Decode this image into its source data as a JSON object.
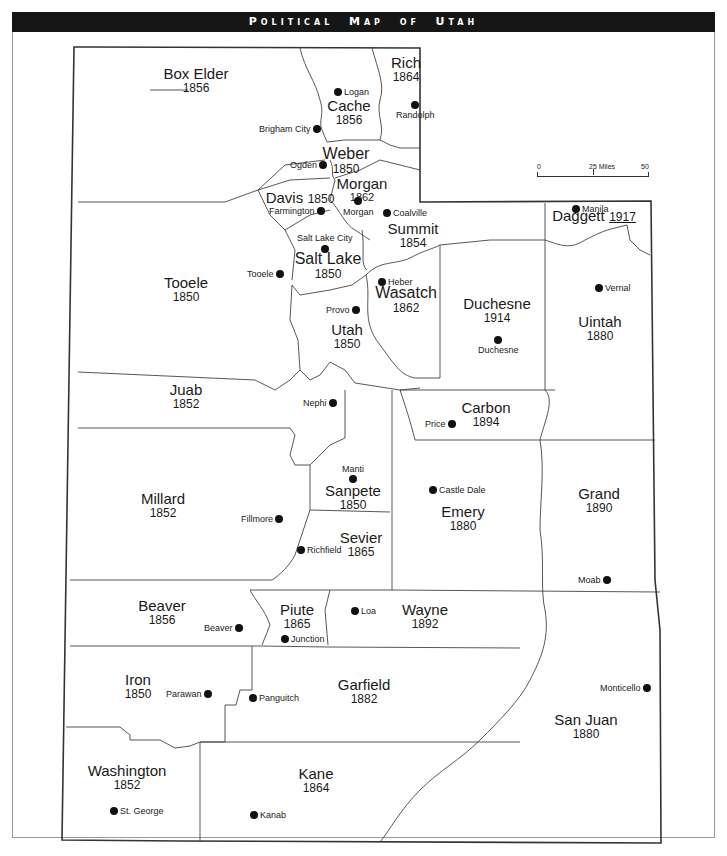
{
  "title": {
    "first_main": "P",
    "first_small": "OLITICAL",
    "second_main": "M",
    "second_small": "AP",
    "third_small": "OF",
    "fourth_main": "U",
    "fourth_small": "TAH",
    "full": "Political Map of Utah"
  },
  "scale_bar": {
    "label_0": "0",
    "label_25": "25 Miles",
    "label_50": "50"
  },
  "counties": {
    "box_elder": {
      "name": "Box Elder",
      "year": "1856"
    },
    "cache": {
      "name": "Cache",
      "year": "1856"
    },
    "rich": {
      "name": "Rich",
      "year": "1864"
    },
    "weber": {
      "name": "Weber",
      "year": "1850"
    },
    "morgan": {
      "name": "Morgan",
      "year": "1862"
    },
    "davis": {
      "name": "Davis",
      "year": "1850"
    },
    "summit": {
      "name": "Summit",
      "year": "1854"
    },
    "daggett": {
      "name": "Daggett",
      "year": "1917"
    },
    "salt_lake": {
      "name": "Salt Lake",
      "year": "1850"
    },
    "tooele": {
      "name": "Tooele",
      "year": "1850"
    },
    "wasatch": {
      "name": "Wasatch",
      "year": "1862"
    },
    "duchesne": {
      "name": "Duchesne",
      "year": "1914"
    },
    "uintah": {
      "name": "Uintah",
      "year": "1880"
    },
    "utah": {
      "name": "Utah",
      "year": "1850"
    },
    "juab": {
      "name": "Juab",
      "year": "1852"
    },
    "carbon": {
      "name": "Carbon",
      "year": "1894"
    },
    "millard": {
      "name": "Millard",
      "year": "1852"
    },
    "sanpete": {
      "name": "Sanpete",
      "year": "1850"
    },
    "emery": {
      "name": "Emery",
      "year": "1880"
    },
    "grand": {
      "name": "Grand",
      "year": "1890"
    },
    "sevier": {
      "name": "Sevier",
      "year": "1865"
    },
    "beaver": {
      "name": "Beaver",
      "year": "1856"
    },
    "piute": {
      "name": "Piute",
      "year": "1865"
    },
    "wayne": {
      "name": "Wayne",
      "year": "1892"
    },
    "iron": {
      "name": "Iron",
      "year": "1850"
    },
    "garfield": {
      "name": "Garfield",
      "year": "1882"
    },
    "san_juan": {
      "name": "San Juan",
      "year": "1880"
    },
    "washington": {
      "name": "Washington",
      "year": "1852"
    },
    "kane": {
      "name": "Kane",
      "year": "1864"
    }
  },
  "cities": {
    "logan": "Logan",
    "randolph": "Randolph",
    "brigham_city": "Brigham City",
    "ogden": "Ogden",
    "morgan": "Morgan",
    "farmington": "Farmington",
    "coalville": "Coalville",
    "manila": "Manila",
    "salt_lake_city": "Salt Lake City",
    "tooele": "Tooele",
    "heber": "Heber",
    "provo": "Provo",
    "vernal": "Vernal",
    "duchesne": "Duchesne",
    "nephi": "Nephi",
    "price": "Price",
    "manti": "Manti",
    "castle_dale": "Castle Dale",
    "fillmore": "Fillmore",
    "richfield": "Richfield",
    "moab": "Moab",
    "loa": "Loa",
    "beaver": "Beaver",
    "junction": "Junction",
    "parawan": "Parawan",
    "panguitch": "Panguitch",
    "monticello": "Monticello",
    "st_george": "St. George",
    "kanab": "Kanab"
  }
}
